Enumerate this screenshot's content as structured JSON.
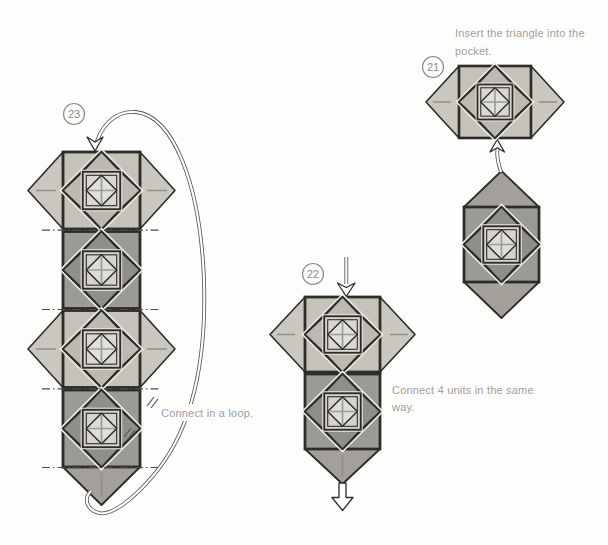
{
  "figure": {
    "kind": "origami assembly instruction diagram",
    "page_background": "#fdfdfb"
  },
  "palette": {
    "paper": "#fdfdfb",
    "ink": "#2e2c29",
    "text_gray": "#9f9f9f",
    "circle_gray": "#8b8b8b",
    "light_base": "#c5c2b9",
    "light_diamond": "#d1cec6",
    "light_flap": "#bcb9b0",
    "light_inner": "#d9d7d0",
    "light_small": "#e2e0da",
    "halo_light": "#eae8e2",
    "dark_base": "#9b9a95",
    "dark_diamond": "#cbc8c0",
    "dark_flap": "#908e89",
    "dark_inner": "#d5d3cc",
    "dark_small": "#dfddd7",
    "halo_dark": "#edebe6",
    "wing_light": "#cac7bf",
    "wing_dark": "#a3a09a",
    "crease": "#8f8f8f",
    "dashdot": "#4c4c4c",
    "cross": "#9c9c9c"
  },
  "steps": [
    {
      "number": "21",
      "instruction": "Insert the triangle into the pocket.",
      "line1": "Insert the triangle into the",
      "line2": "pocket.",
      "arrow": "hollow-up-arrow-icon"
    },
    {
      "number": "22",
      "instruction": "Connect 4 units in the same way.",
      "line1": "Connect 4 units in the same",
      "line2": "way.",
      "arrow": "double-line-down-arrow-icon"
    },
    {
      "number": "23",
      "instruction": "Connect in a loop.",
      "line1": "Connect in a loop.",
      "arrow": "loop-arrow-icon"
    }
  ]
}
